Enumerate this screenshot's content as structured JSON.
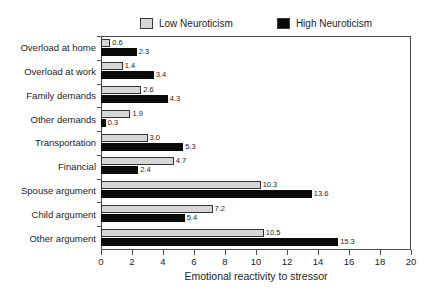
{
  "chart_data": {
    "type": "bar",
    "orientation": "horizontal",
    "title": "",
    "xlabel": "Emotional reactivity to stressor",
    "ylabel": "",
    "xlim": [
      0,
      20
    ],
    "xticks": [
      0,
      2,
      4,
      6,
      8,
      10,
      12,
      14,
      16,
      18,
      20
    ],
    "grid": false,
    "legend_position": "top-center",
    "categories": [
      "Overload at home",
      "Overload at work",
      "Family demands",
      "Other demands",
      "Transportation",
      "Financial",
      "Spouse argument",
      "Child argument",
      "Other argument"
    ],
    "series": [
      {
        "name": "Low Neuroticism",
        "color": "#d6d6d6",
        "values": [
          0.6,
          1.4,
          2.6,
          1.9,
          3.0,
          4.7,
          10.3,
          7.2,
          10.5
        ],
        "value_labels": [
          "0.6",
          "1.4",
          "2.6",
          "1.9",
          "3.0",
          "4.7",
          "10.3",
          "7.2",
          "10.5"
        ]
      },
      {
        "name": "High Neuroticism",
        "color": "#0a0a0a",
        "values": [
          2.3,
          3.4,
          4.3,
          0.3,
          5.3,
          2.4,
          13.6,
          5.4,
          15.3
        ],
        "value_labels": [
          "2.3",
          "3.4",
          "4.3",
          "0.3",
          "5.3",
          "2.4",
          "13.6",
          "5.4",
          "15.3"
        ]
      }
    ]
  },
  "legend": {
    "entries": [
      {
        "label": "Low Neuroticism",
        "swatch": "low-neuroticism-swatch"
      },
      {
        "label": "High Neuroticism",
        "swatch": "high-neuroticism-swatch"
      }
    ]
  },
  "axis": {
    "x_title": "Emotional reactivity to stressor"
  }
}
